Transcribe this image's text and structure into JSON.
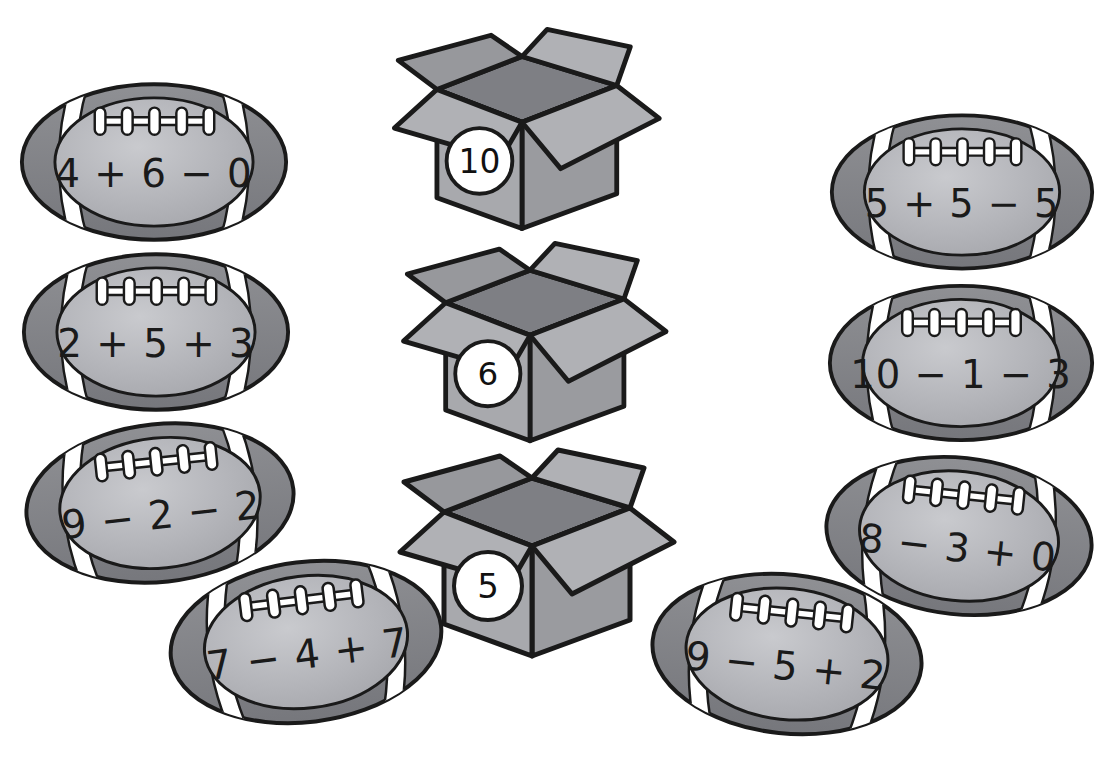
{
  "worksheet": {
    "type": "math-sorting-activity",
    "theme": "footballs-and-boxes",
    "colors": {
      "ball_outer": "#8f9094",
      "ball_outer_dark": "#76777c",
      "ball_panel_light": "#c9cace",
      "ball_panel_mid": "#b3b4b9",
      "stripe": "#ffffff",
      "lace": "#ffffff",
      "outline": "#1a1a1a",
      "box_front": "#a8a9ad",
      "box_side": "#9a9b9f",
      "box_flap": "#b0b1b5",
      "box_flap_dark": "#97989c",
      "box_interior": "#7e7f84",
      "badge": "#ffffff",
      "page": "#ffffff"
    }
  },
  "footballs": [
    {
      "id": "ball-1",
      "expression": "4 + 6 − 0",
      "column": "left",
      "x": 18,
      "y": 78,
      "w": 272,
      "h": 168,
      "rotate": 0,
      "sum": 10
    },
    {
      "id": "ball-2",
      "expression": "2 + 5 + 3",
      "column": "left",
      "x": 20,
      "y": 248,
      "w": 272,
      "h": 168,
      "rotate": 0,
      "sum": 10
    },
    {
      "id": "ball-3",
      "expression": "9 − 2 − 2",
      "column": "left",
      "x": 22,
      "y": 418,
      "w": 276,
      "h": 170,
      "rotate": -6,
      "sum": 5
    },
    {
      "id": "ball-4",
      "expression": "7 − 4 + 7",
      "column": "left",
      "x": 166,
      "y": 556,
      "w": 280,
      "h": 172,
      "rotate": -7,
      "sum": 10
    },
    {
      "id": "ball-5",
      "expression": "5 + 5 − 5",
      "column": "right",
      "x": 828,
      "y": 108,
      "w": 268,
      "h": 168,
      "rotate": 0,
      "sum": 5
    },
    {
      "id": "ball-6",
      "expression": "10 − 1 − 3",
      "column": "right",
      "x": 826,
      "y": 278,
      "w": 270,
      "h": 170,
      "rotate": 0,
      "sum": 6
    },
    {
      "id": "ball-7",
      "expression": "8 − 3 + 0",
      "column": "right",
      "x": 822,
      "y": 450,
      "w": 274,
      "h": 172,
      "rotate": 6,
      "sum": 5
    },
    {
      "id": "ball-8",
      "expression": "9 − 5 + 2",
      "column": "right",
      "x": 648,
      "y": 568,
      "w": 278,
      "h": 172,
      "rotate": 6,
      "sum": 6
    }
  ],
  "boxes": [
    {
      "id": "box-10",
      "label": "10",
      "x": 372,
      "y": 14,
      "w": 300,
      "h": 232
    },
    {
      "id": "box-6",
      "label": "6",
      "x": 382,
      "y": 228,
      "w": 296,
      "h": 230
    },
    {
      "id": "box-5",
      "label": "5",
      "x": 382,
      "y": 434,
      "w": 300,
      "h": 240
    }
  ]
}
